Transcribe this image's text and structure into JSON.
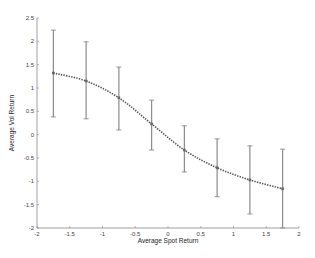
{
  "chart_data": {
    "type": "line",
    "title": "",
    "xlabel": "Average Spot Return",
    "ylabel": "Average Vol Return",
    "xlim": [
      -2,
      2
    ],
    "ylim": [
      -2,
      2.5
    ],
    "xticks": [
      -2,
      -1.5,
      -1,
      -0.5,
      0,
      0.5,
      1,
      1.5,
      2
    ],
    "xtick_labels": [
      "-2",
      "-1.5",
      "-1",
      "-0.5",
      "0",
      "0.5",
      "1",
      "1.5",
      "2"
    ],
    "yticks": [
      -2,
      -1.5,
      -1,
      -0.5,
      0,
      0.5,
      1,
      1.5,
      2,
      2.5
    ],
    "ytick_labels": [
      "-2",
      "-1.5",
      "-1",
      "-0.5",
      "0",
      "0.5",
      "1",
      "1.5",
      "2",
      "2.5"
    ],
    "grid": false,
    "legend": null,
    "series": [
      {
        "name": "Mean with error bars",
        "style": "dotted line with markers and vertical error bars",
        "x": [
          -1.75,
          -1.25,
          -0.75,
          -0.25,
          0.25,
          0.75,
          1.25,
          1.75
        ],
        "y": [
          1.32,
          1.15,
          0.79,
          0.23,
          -0.33,
          -0.71,
          -0.97,
          -1.16
        ],
        "upper": [
          2.24,
          1.99,
          1.45,
          0.74,
          0.19,
          -0.09,
          -0.24,
          -0.31
        ],
        "lower": [
          0.38,
          0.34,
          0.1,
          -0.33,
          -0.8,
          -1.33,
          -1.7,
          -2.0
        ]
      }
    ]
  },
  "colors": {
    "line": "#555555",
    "error_bar": "#8a8a8a",
    "axis": "#888888",
    "text": "#333333"
  }
}
